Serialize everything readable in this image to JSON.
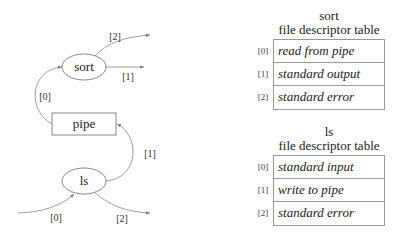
{
  "diagram": {
    "nodes": {
      "sort": {
        "label": "sort",
        "shape": "ellipse"
      },
      "pipe": {
        "label": "pipe",
        "shape": "rectangle"
      },
      "ls": {
        "label": "ls",
        "shape": "ellipse"
      }
    },
    "edge_labels": {
      "sort_out2": "[2]",
      "sort_out1": "[1]",
      "pipe_to_sort0": "[0]",
      "ls_to_pipe1": "[1]",
      "ls_in0": "[0]",
      "ls_out2": "[2]"
    },
    "colors": {
      "stroke": "#888888",
      "text": "#222222"
    }
  },
  "tables": {
    "sort": {
      "title_line1": "sort",
      "title_line2": "file descriptor table",
      "rows": [
        {
          "index": "[0]",
          "value": "read from pipe"
        },
        {
          "index": "[1]",
          "value": "standard output"
        },
        {
          "index": "[2]",
          "value": "standard error"
        }
      ]
    },
    "ls": {
      "title_line1": "ls",
      "title_line2": "file descriptor table",
      "rows": [
        {
          "index": "[0]",
          "value": "standard input"
        },
        {
          "index": "[1]",
          "value": "write to pipe"
        },
        {
          "index": "[2]",
          "value": "standard error"
        }
      ]
    }
  }
}
